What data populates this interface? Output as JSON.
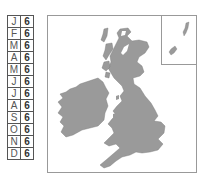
{
  "calendar": {
    "rows": [
      {
        "month": "J",
        "value": "6"
      },
      {
        "month": "F",
        "value": "6"
      },
      {
        "month": "M",
        "value": "6"
      },
      {
        "month": "A",
        "value": "6"
      },
      {
        "month": "M",
        "value": "6"
      },
      {
        "month": "J",
        "value": "6"
      },
      {
        "month": "J",
        "value": "6"
      },
      {
        "month": "A",
        "value": "6"
      },
      {
        "month": "S",
        "value": "6"
      },
      {
        "month": "O",
        "value": "6"
      },
      {
        "month": "N",
        "value": "6"
      },
      {
        "month": "D",
        "value": "6"
      }
    ]
  },
  "map": {
    "region": "British Isles",
    "land_color": "#9a9a9a",
    "inset_label": "Shetland / Orkney inset"
  }
}
